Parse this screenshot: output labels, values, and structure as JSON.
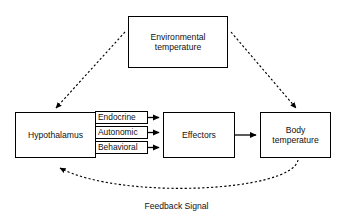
{
  "diagram": {
    "background_color": "#ffffff",
    "stroke_color": "#000000",
    "text_color": "#111111",
    "nodes": {
      "environmental_temperature": "Environmental\ntemperature",
      "hypothalamus": "Hypothalamus",
      "effectors": "Effectors",
      "body_temperature": "Body\ntemperature"
    },
    "pathway_labels": {
      "endocrine": "Endocrine",
      "autonomic": "Autonomic",
      "behavioral": "Behavioral"
    },
    "feedback_caption": "Feedback Signal",
    "edges": [
      {
        "name": "environmental-to-hypothalamus",
        "from": "environmental_temperature",
        "to": "hypothalamus",
        "style": "dashed",
        "arrow": "single"
      },
      {
        "name": "environmental-to-body-temperature",
        "from": "environmental_temperature",
        "to": "body_temperature",
        "style": "dashed",
        "arrow": "single"
      },
      {
        "name": "hypothalamus-endocrine-to-effectors",
        "from": "hypothalamus",
        "to": "effectors",
        "style": "solid",
        "arrow": "single",
        "label": "Endocrine"
      },
      {
        "name": "hypothalamus-autonomic-to-effectors",
        "from": "hypothalamus",
        "to": "effectors",
        "style": "solid",
        "arrow": "single",
        "label": "Autonomic"
      },
      {
        "name": "hypothalamus-behavioral-to-effectors",
        "from": "hypothalamus",
        "to": "effectors",
        "style": "solid",
        "arrow": "single",
        "label": "Behavioral"
      },
      {
        "name": "effectors-to-body-temperature",
        "from": "effectors",
        "to": "body_temperature",
        "style": "solid",
        "arrow": "single"
      },
      {
        "name": "body-temperature-feedback-to-hypothalamus",
        "from": "body_temperature",
        "to": "hypothalamus",
        "style": "dashed",
        "arrow": "single",
        "label": "Feedback Signal"
      }
    ]
  }
}
